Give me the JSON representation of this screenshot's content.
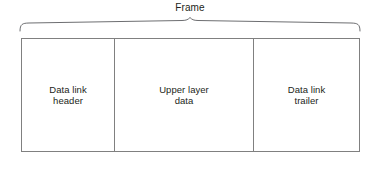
{
  "diagram": {
    "title": "Frame",
    "brace": {
      "span_start_x": 20,
      "span_end_x": 360,
      "peak_x": 190,
      "stroke_color": "#6d6e71"
    },
    "box": {
      "border_color": "#808080",
      "fill_color": "#ffffff",
      "text_color": "#231f20"
    },
    "cells": [
      {
        "id": "data-link-header",
        "label": "Data link\nheader",
        "line1": "Data link",
        "line2": "header"
      },
      {
        "id": "upper-layer-data",
        "label": "Upper layer\ndata",
        "line1": "Upper layer",
        "line2": "data"
      },
      {
        "id": "data-link-trailer",
        "label": "Data link\ntrailer",
        "line1": "Data link",
        "line2": "trailer"
      }
    ]
  }
}
